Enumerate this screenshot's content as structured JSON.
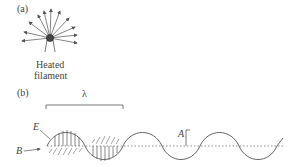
{
  "panel_a": {
    "label": "(a)",
    "caption_line1": "Heated",
    "caption_line2": "filament",
    "arrow_count": 11
  },
  "panel_b": {
    "label": "(b)",
    "wavelength_symbol": "λ",
    "electric_field_label": "E",
    "magnetic_field_label": "B",
    "amplitude_label": "A"
  },
  "colors": {
    "line": "#555555",
    "filament": "#444444"
  }
}
